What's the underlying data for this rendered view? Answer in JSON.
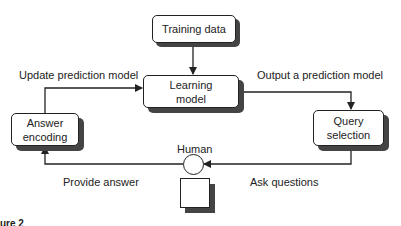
{
  "diagram": {
    "nodes": {
      "training_data": "Training data",
      "learning_model": [
        "Learning",
        "model"
      ],
      "answer_encoding": [
        "Answer",
        "encoding"
      ],
      "query_selection": [
        "Query",
        "selection"
      ],
      "human": "Human"
    },
    "edges": {
      "update": "Update prediction model",
      "output": "Output a prediction model",
      "provide": "Provide answer",
      "ask": "Ask questions"
    },
    "caption_fragment": "ure 2"
  },
  "colors": {
    "line": "#222222",
    "shadow": "#444444",
    "background": "#ffffff"
  }
}
